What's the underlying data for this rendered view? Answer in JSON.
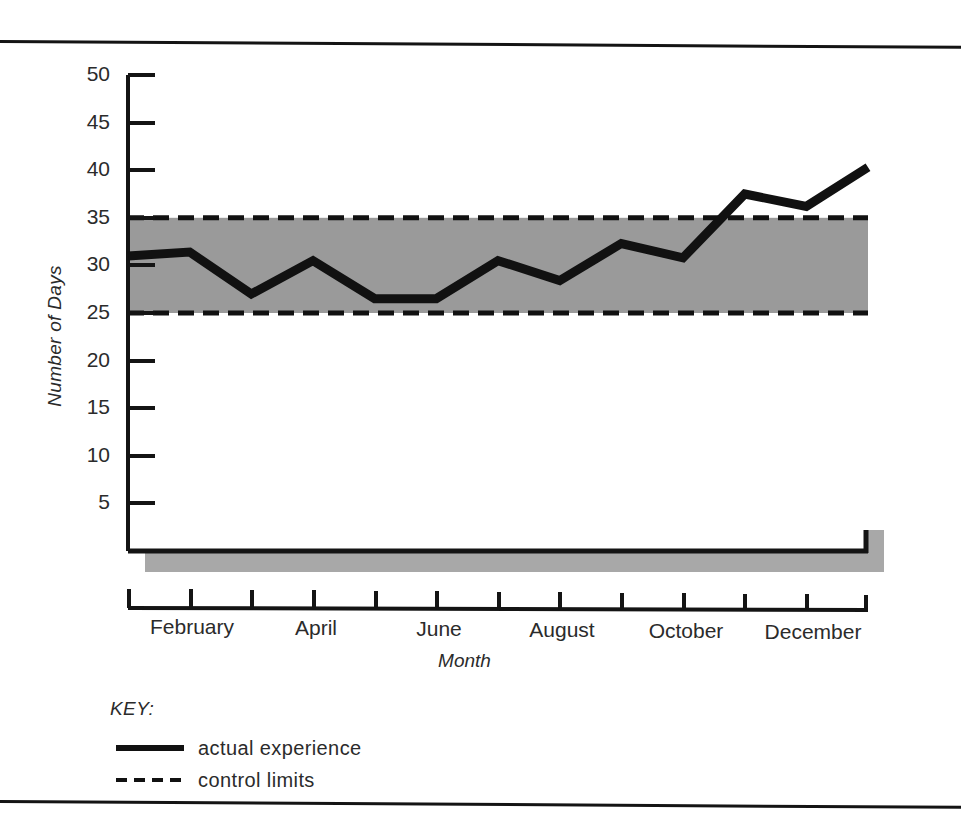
{
  "chart_data": {
    "type": "line",
    "title": "",
    "xlabel": "Month",
    "ylabel": "Number of Days",
    "ylim": [
      0,
      50
    ],
    "yticks": [
      5,
      10,
      15,
      20,
      25,
      30,
      35,
      40,
      45,
      50
    ],
    "grid": false,
    "categories": [
      "January",
      "February",
      "March",
      "April",
      "May",
      "June",
      "July",
      "August",
      "September",
      "October",
      "November",
      "December"
    ],
    "xtick_labels": [
      "February",
      "April",
      "June",
      "August",
      "October",
      "December"
    ],
    "xtick_label_months": [
      2,
      4,
      6,
      8,
      10,
      12
    ],
    "series": [
      {
        "name": "actual experience",
        "style": "solid",
        "color": "#111111",
        "values": [
          31.0,
          31.4,
          27.0,
          30.5,
          26.5,
          26.5,
          30.5,
          28.4,
          32.3,
          30.8,
          37.5,
          36.2
        ],
        "end_value": 40.3
      },
      {
        "name": "control limits",
        "style": "dashed",
        "color": "#111111",
        "upper": 35,
        "lower": 25
      }
    ],
    "band": {
      "label": "control band",
      "upper": 35,
      "lower": 25,
      "fill": "#9a9a9a"
    },
    "legend": {
      "position": "below-left",
      "title": "KEY:",
      "entries": [
        {
          "label": "actual experience",
          "style": "solid"
        },
        {
          "label": "control limits",
          "style": "dashed"
        }
      ]
    }
  },
  "colors": {
    "line": "#111111",
    "band_fill": "#9a9a9a",
    "axis": "#141414",
    "shadow": "#a0a0a0",
    "text": "#2b2b2b"
  }
}
